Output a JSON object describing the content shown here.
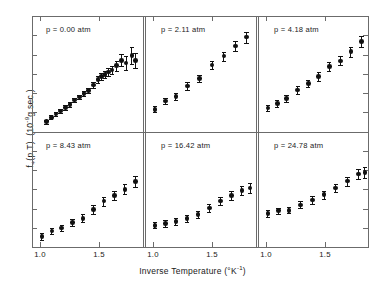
{
  "figure": {
    "ylabel_main": "f",
    "ylabel_sub": "+",
    "ylabel_args": "(p,T)",
    "ylabel_units_open": "(10",
    "ylabel_units_exp": "-9",
    "ylabel_units_close": "g sec )",
    "xlabel_text": "Inverse Temperature  (°K",
    "xlabel_exp": "-1",
    "xlabel_close": ")",
    "axis_color": "#6b6b6b",
    "marker_color": "#111111"
  },
  "chart_data": {
    "type": "scatter",
    "title": "",
    "xlabel": "Inverse Temperature (°K⁻¹)",
    "ylabel": "f₊(p,T) (10⁻⁹ g sec)",
    "xlim": [
      0.93,
      1.88
    ],
    "ylim": [
      0,
      1
    ],
    "xticks": [
      1.0,
      1.5
    ],
    "xticklabels": [
      "1.0",
      "1.5"
    ],
    "yticks_unlabeled": 5,
    "grid": false,
    "legend": "none",
    "error_bars": "vertical, symmetric",
    "panel_layout": {
      "rows": 2,
      "cols": 3
    },
    "panels": [
      {
        "index": 0,
        "row": 0,
        "col": 0,
        "label": "p = 0.00 atm",
        "pressure_atm": 0.0,
        "x": [
          1.055,
          1.095,
          1.135,
          1.175,
          1.215,
          1.255,
          1.295,
          1.335,
          1.375,
          1.415,
          1.455,
          1.495,
          1.525,
          1.555,
          1.585,
          1.615,
          1.655,
          1.695,
          1.735,
          1.785,
          1.815
        ],
        "y": [
          0.055,
          0.095,
          0.125,
          0.155,
          0.185,
          0.215,
          0.255,
          0.285,
          0.315,
          0.345,
          0.395,
          0.445,
          0.475,
          0.495,
          0.515,
          0.535,
          0.575,
          0.625,
          0.6,
          0.67,
          0.625
        ],
        "yerr": [
          0.018,
          0.018,
          0.018,
          0.018,
          0.02,
          0.02,
          0.022,
          0.022,
          0.024,
          0.026,
          0.028,
          0.03,
          0.032,
          0.034,
          0.036,
          0.04,
          0.048,
          0.055,
          0.062,
          0.075,
          0.07
        ]
      },
      {
        "index": 1,
        "row": 0,
        "col": 1,
        "label": "p = 2.11 atm",
        "pressure_atm": 2.11,
        "x": [
          1.015,
          1.105,
          1.195,
          1.295,
          1.395,
          1.505,
          1.605,
          1.705,
          1.8
        ],
        "y": [
          0.17,
          0.245,
          0.29,
          0.385,
          0.455,
          0.58,
          0.665,
          0.76,
          0.84
        ],
        "yerr": [
          0.03,
          0.03,
          0.032,
          0.034,
          0.036,
          0.04,
          0.042,
          0.046,
          0.05
        ]
      },
      {
        "index": 2,
        "row": 0,
        "col": 2,
        "label": "p = 4.18 atm",
        "pressure_atm": 4.18,
        "x": [
          1.015,
          1.095,
          1.175,
          1.27,
          1.36,
          1.45,
          1.54,
          1.635,
          1.725,
          1.815
        ],
        "y": [
          0.18,
          0.225,
          0.27,
          0.35,
          0.41,
          0.475,
          0.565,
          0.62,
          0.705,
          0.8
        ],
        "yerr": [
          0.03,
          0.03,
          0.032,
          0.034,
          0.036,
          0.038,
          0.04,
          0.042,
          0.045,
          0.048
        ]
      },
      {
        "index": 3,
        "row": 1,
        "col": 0,
        "label": "p = 8.43 atm",
        "pressure_atm": 8.43,
        "x": [
          1.015,
          1.1,
          1.185,
          1.275,
          1.365,
          1.455,
          1.545,
          1.635,
          1.725,
          1.815
        ],
        "y": [
          0.06,
          0.11,
          0.14,
          0.19,
          0.23,
          0.31,
          0.39,
          0.44,
          0.5,
          0.57
        ],
        "yerr": [
          0.03,
          0.03,
          0.032,
          0.034,
          0.036,
          0.04,
          0.042,
          0.044,
          0.046,
          0.05
        ]
      },
      {
        "index": 4,
        "row": 1,
        "col": 1,
        "label": "p = 16.42 atm",
        "pressure_atm": 16.42,
        "x": [
          1.015,
          1.105,
          1.195,
          1.29,
          1.385,
          1.48,
          1.575,
          1.67,
          1.76,
          1.83
        ],
        "y": [
          0.165,
          0.18,
          0.2,
          0.23,
          0.265,
          0.325,
          0.39,
          0.44,
          0.49,
          0.51
        ],
        "yerr": [
          0.03,
          0.03,
          0.03,
          0.032,
          0.034,
          0.036,
          0.038,
          0.04,
          0.042,
          0.044
        ]
      },
      {
        "index": 5,
        "row": 1,
        "col": 2,
        "label": "p = 24.78 atm",
        "pressure_atm": 24.78,
        "x": [
          1.015,
          1.105,
          1.195,
          1.295,
          1.395,
          1.495,
          1.595,
          1.695,
          1.79,
          1.845
        ],
        "y": [
          0.275,
          0.3,
          0.305,
          0.355,
          0.4,
          0.45,
          0.51,
          0.575,
          0.64,
          0.655
        ],
        "yerr": [
          0.03,
          0.03,
          0.03,
          0.032,
          0.034,
          0.038,
          0.04,
          0.042,
          0.046,
          0.048
        ]
      }
    ]
  }
}
